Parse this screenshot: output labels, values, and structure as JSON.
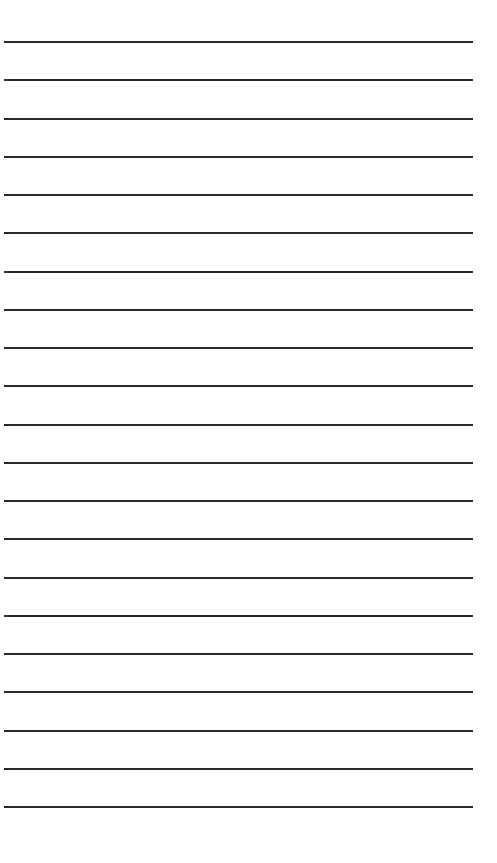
{
  "page": {
    "type": "lined-paper",
    "background_color": "#ffffff",
    "line_color": "#2a2a2a",
    "line_count": 21,
    "first_line_y": 41,
    "line_spacing": 38.25,
    "line_left": 4,
    "line_width": 469
  }
}
